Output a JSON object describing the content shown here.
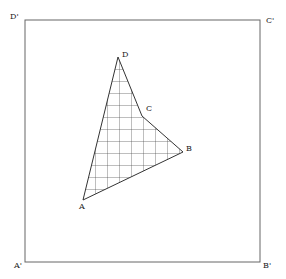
{
  "diagram": {
    "square": {
      "corners": {
        "A'": [
          25,
          262
        ],
        "B'": [
          260,
          262
        ],
        "C'": [
          260,
          20
        ],
        "D'": [
          25,
          20
        ]
      },
      "stroke": "#555555"
    },
    "square_labels": {
      "d_prime": "D'",
      "c_prime": "C'",
      "a_prime": "A'",
      "b_prime": "B'"
    },
    "quadrilateral": {
      "vertices": {
        "A": [
          83,
          200
        ],
        "B": [
          183,
          152
        ],
        "C": [
          142,
          116
        ],
        "D": [
          118,
          57
        ]
      },
      "hatch": "grid",
      "stroke": "#333333"
    },
    "quad_labels": {
      "a": "A",
      "b": "B",
      "c": "C",
      "d": "D"
    }
  }
}
